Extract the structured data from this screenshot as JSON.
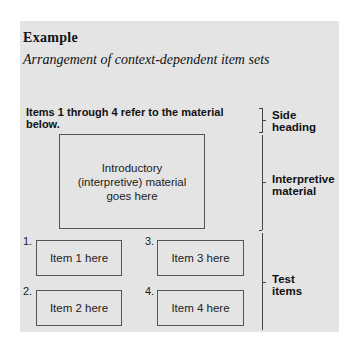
{
  "header": {
    "title": "Example",
    "subtitle": "Arrangement of context-dependent item sets"
  },
  "instruction": "Items 1 through 4 refer to the material below.",
  "interpretive_box": "Introductory (interpretive) material goes here",
  "items": [
    {
      "number": "1.",
      "label": "Item 1 here"
    },
    {
      "number": "2.",
      "label": "Item 2 here"
    },
    {
      "number": "3.",
      "label": "Item 3 here"
    },
    {
      "number": "4.",
      "label": "Item 4 here"
    }
  ],
  "side_labels": {
    "side_heading": "Side heading",
    "interpretive": "Interpretive material",
    "test_items": "Test items"
  }
}
